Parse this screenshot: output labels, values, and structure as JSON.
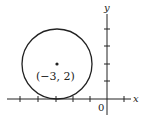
{
  "figure": {
    "type": "circle-on-coordinate-plane",
    "axes": {
      "x_label": "x",
      "y_label": "y",
      "origin_label": "0"
    },
    "circle": {
      "center": [
        -3,
        2
      ],
      "radius": 2,
      "center_label": "(−3, 2)"
    },
    "colors": {
      "stroke": "#222222",
      "background": "#ffffff"
    }
  }
}
